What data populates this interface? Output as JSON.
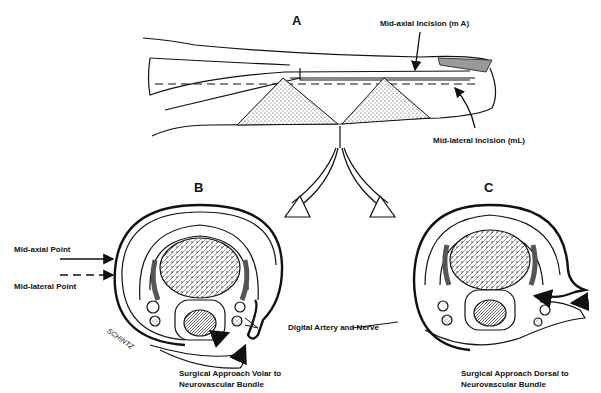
{
  "figure": {
    "panels": {
      "a": "A",
      "b": "B",
      "c": "C"
    },
    "labels": {
      "mid_axial_incision": "Mid-axial Incision  (m A)",
      "mid_lateral_incision": "Mid-lateral Incision  (mL)",
      "mid_axial_point": "Mid-axial Point",
      "mid_lateral_point": "Mid-lateral Point",
      "digital_artery_nerve": "Digital Artery and Nerve",
      "signature": "SCHINTZ"
    },
    "captions": {
      "b_line1": "Surgical Approach Volar to",
      "b_line2": "Neurovascular Bundle",
      "c_line1": "Surgical Approach Dorsal to",
      "c_line2": "Neurovascular Bundle"
    }
  }
}
